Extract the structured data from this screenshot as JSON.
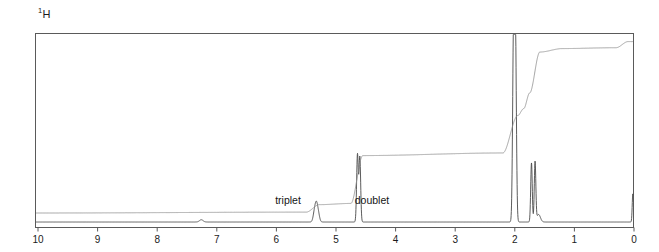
{
  "figure": {
    "nucleus_superscript": "1",
    "nucleus_symbol": "H",
    "nucleus_label": "1H"
  },
  "annotations": [
    {
      "id": "triplet",
      "label": "triplet",
      "ppm": 5.35,
      "x_px": 288,
      "y_px": 204
    },
    {
      "id": "doublet",
      "label": "doublet",
      "ppm": 4.62,
      "x_px": 372,
      "y_px": 204
    }
  ],
  "axis": {
    "label": "",
    "unit": "ppm",
    "direction": "reversed",
    "ticks": [
      "10",
      "9",
      "8",
      "7",
      "6",
      "5",
      "4",
      "3",
      "2",
      "1",
      "0"
    ]
  },
  "colors": {
    "frame": "#5a5a5a",
    "trace": "#4a4a4a",
    "integral": "#8d8d8d",
    "text": "#1a1a1a",
    "background": "#ffffff"
  },
  "chart_data": {
    "type": "line",
    "xlabel": "ppm",
    "ylabel": "intensity",
    "xlim": [
      10,
      -0.35
    ],
    "ylim": [
      0,
      1
    ],
    "grid": false,
    "legend": "none",
    "x_axis_reversed": true,
    "tick_values": [
      10,
      9,
      8,
      7,
      6,
      5,
      4,
      3,
      2,
      1,
      0
    ],
    "series": [
      {
        "name": "spectrum",
        "peaks": [
          {
            "ppm": 7.26,
            "height": 0.012,
            "width": 0.03,
            "assignment": "residual CHCl3"
          },
          {
            "ppm": 5.36,
            "height": 0.055,
            "width": 0.022,
            "assignment": "triplet"
          },
          {
            "ppm": 5.33,
            "height": 0.07,
            "width": 0.02,
            "assignment": "triplet"
          },
          {
            "ppm": 5.3,
            "height": 0.05,
            "width": 0.022,
            "assignment": "triplet"
          },
          {
            "ppm": 4.64,
            "height": 0.36,
            "width": 0.014,
            "assignment": "doublet"
          },
          {
            "ppm": 4.6,
            "height": 0.345,
            "width": 0.014,
            "assignment": "doublet"
          },
          {
            "ppm": 2.02,
            "height": 1.0,
            "width": 0.016,
            "assignment": "clipped at frame top"
          },
          {
            "ppm": 1.99,
            "height": 1.0,
            "width": 0.016,
            "assignment": "clipped at frame top"
          },
          {
            "ppm": 1.72,
            "height": 0.315,
            "width": 0.013,
            "assignment": ""
          },
          {
            "ppm": 1.66,
            "height": 0.32,
            "width": 0.013,
            "assignment": ""
          },
          {
            "ppm": 1.6,
            "height": 0.04,
            "width": 0.03,
            "assignment": ""
          },
          {
            "ppm": 0.02,
            "height": 0.15,
            "width": 0.01,
            "assignment": "TMS reference"
          }
        ]
      },
      {
        "name": "integral",
        "steps": [
          {
            "ppm": 10.0,
            "cumulative": 0.0
          },
          {
            "ppm": 5.5,
            "cumulative": 0.005
          },
          {
            "ppm": 5.28,
            "cumulative": 0.048
          },
          {
            "ppm": 4.75,
            "cumulative": 0.055
          },
          {
            "ppm": 4.55,
            "cumulative": 0.33
          },
          {
            "ppm": 2.2,
            "cumulative": 0.345
          },
          {
            "ppm": 1.95,
            "cumulative": 0.56
          },
          {
            "ppm": 1.85,
            "cumulative": 0.6
          },
          {
            "ppm": 1.75,
            "cumulative": 0.69
          },
          {
            "ppm": 1.58,
            "cumulative": 0.925
          },
          {
            "ppm": 1.2,
            "cumulative": 0.945
          },
          {
            "ppm": 0.3,
            "cumulative": 0.95
          },
          {
            "ppm": 0.1,
            "cumulative": 0.985
          },
          {
            "ppm": -0.35,
            "cumulative": 0.988
          }
        ]
      }
    ]
  }
}
